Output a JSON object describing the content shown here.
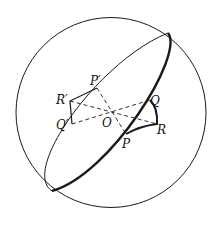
{
  "diagram": {
    "type": "sphere-reflection",
    "colors": {
      "stroke": "#1a1a1a",
      "background": "#ffffff"
    },
    "sphere": {
      "cx": 111,
      "cy": 112.5,
      "r": 95
    },
    "center": {
      "label": "O",
      "x": 112,
      "y": 111
    },
    "points": {
      "P": {
        "label": "P",
        "x": 126,
        "y": 134
      },
      "Q": {
        "label": "Q",
        "x": 150,
        "y": 100
      },
      "R": {
        "label": "R",
        "x": 157,
        "y": 124
      },
      "P_prime": {
        "label": "P′",
        "x": 97,
        "y": 88
      },
      "Q_prime": {
        "label": "Q′",
        "x": 72,
        "y": 124
      },
      "R_prime": {
        "label": "R′",
        "x": 70,
        "y": 101
      }
    }
  }
}
